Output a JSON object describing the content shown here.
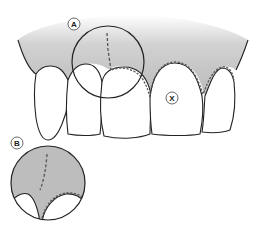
{
  "diagram": {
    "labels": {
      "a": "A",
      "b": "B",
      "x": "X"
    },
    "colors": {
      "gum": "#bdbdbd",
      "outline": "#222222",
      "tooth": "#ffffff",
      "dashed_line": "#555555"
    },
    "callouts": [
      {
        "id": "A",
        "description": "magnifier circle over interdental papilla between left central incisors, dashed incision line"
      },
      {
        "id": "B",
        "description": "detail inset showing dashed incision line and dashed gingival margin"
      },
      {
        "id": "X",
        "description": "marked tooth (right central incisor)"
      }
    ]
  }
}
